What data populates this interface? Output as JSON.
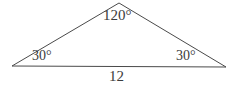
{
  "figure": {
    "kind": "triangle-diagram",
    "background_color": "#ffffff",
    "stroke_color": "#4a4a4a",
    "text_color": "#3b3b3b",
    "stroke_width": 1
  },
  "labels": {
    "apex_angle": "120°",
    "left_angle": "30°",
    "right_angle": "30°",
    "base_length": "12"
  },
  "geometry": {
    "apex": {
      "x": 119,
      "y": 3
    },
    "left_vertex": {
      "x": 12,
      "y": 66
    },
    "right_vertex": {
      "x": 226,
      "y": 67
    }
  }
}
